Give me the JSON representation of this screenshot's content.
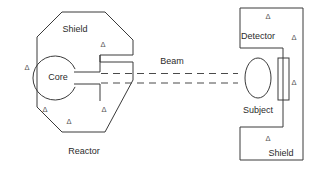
{
  "figure": {
    "background_color": "#ffffff",
    "line_color": "#3a3a3a",
    "text_color": "#2b2b2b",
    "marker_color": "#555555",
    "width": 310,
    "height": 172
  },
  "labels": {
    "reactor": "Reactor",
    "shield_left": "Shield",
    "core": "Core",
    "beam": "Beam",
    "detector": "Detector",
    "subject": "Subject",
    "shield_right": "Shield"
  },
  "markers": {
    "glyph": "Δ",
    "name": "delta-marker",
    "count": 9,
    "positions": [
      {
        "id": "delta-reactor-upper-right",
        "x": 103,
        "y": 45
      },
      {
        "id": "delta-reactor-left",
        "x": 27,
        "y": 68
      },
      {
        "id": "delta-reactor-lower-left",
        "x": 45,
        "y": 110
      },
      {
        "id": "delta-reactor-bottom",
        "x": 69,
        "y": 122
      },
      {
        "id": "delta-reactor-lower-right",
        "x": 104,
        "y": 110
      },
      {
        "id": "delta-shield-top",
        "x": 268,
        "y": 17
      },
      {
        "id": "delta-shield-upper-right",
        "x": 294,
        "y": 38
      },
      {
        "id": "delta-shield-mid-right",
        "x": 294,
        "y": 83
      },
      {
        "id": "delta-shield-bottom",
        "x": 268,
        "y": 139
      }
    ]
  },
  "shapes": {
    "reactor_shield_octagon": {
      "name": "reactor-shield-outline",
      "points": "37,37 62,12 105,12 133,40 133,55 100,55 100,62 133,62 133,67 133,80 105,132 62,132 37,107"
    },
    "core_circle": {
      "name": "reactor-core",
      "cx": 58,
      "cy": 78,
      "r": 22
    },
    "beam_channel": {
      "name": "beam-channel",
      "top_y": 72,
      "bottom_y": 84,
      "x_start": 58,
      "x_end": 133
    },
    "subject_ellipse": {
      "name": "subject-body",
      "cx": 258,
      "cy": 78,
      "rx": 13,
      "ry": 20
    },
    "detector_rect": {
      "name": "detector-body",
      "x": 278,
      "y": 58,
      "width": 11,
      "height": 42
    },
    "right_shield_polygon": {
      "name": "right-shield-outline",
      "points": "240,8 303,8 303,160 240,160 240,127 283,127 283,48 240,48"
    },
    "beam_dashes": {
      "name": "beam-rays",
      "upper_y": 73,
      "lower_y": 83,
      "x_start": 101,
      "x_end": 238
    }
  },
  "label_positions": {
    "reactor": {
      "x": 84,
      "y": 152
    },
    "shield_left": {
      "x": 75,
      "y": 30
    },
    "core": {
      "x": 58,
      "y": 78
    },
    "beam": {
      "x": 172,
      "y": 62
    },
    "detector": {
      "x": 258,
      "y": 37
    },
    "subject": {
      "x": 258,
      "y": 111
    },
    "shield_right": {
      "x": 281,
      "y": 154
    }
  }
}
